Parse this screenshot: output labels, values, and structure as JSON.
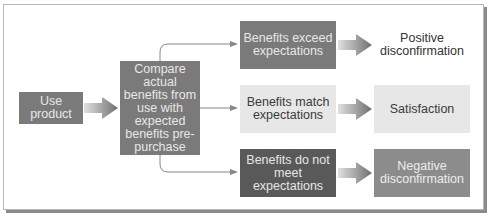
{
  "diagram": {
    "start": {
      "label": "Use product"
    },
    "compare": {
      "label": "Compare actual benefits from use with expected benefits pre-purchase"
    },
    "branches": [
      {
        "condition": "Benefits exceed expectations",
        "outcome": "Positive disconfirmation"
      },
      {
        "condition": "Benefits match expectations",
        "outcome": "Satisfaction"
      },
      {
        "condition": "Benefits do not meet expectations",
        "outcome": "Negative disconfirmation"
      }
    ]
  },
  "colors": {
    "mid_gray": "#7a7a7a",
    "dark_gray": "#595959",
    "light_gray": "#e7e7e7",
    "outcome_gray": "#8c8c8c"
  }
}
